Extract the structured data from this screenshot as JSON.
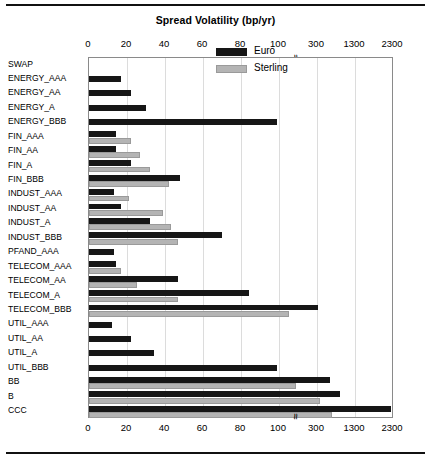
{
  "figure": {
    "title": "Spread Volatility (bp/yr)",
    "axis_break_symbol": "≈",
    "border_color": "#8a8a8a",
    "grid_color": "#dcdcdc"
  },
  "legend": {
    "position": "top-right-inside",
    "entries": [
      {
        "label": "Euro",
        "color": "#161616"
      },
      {
        "label": "Sterling",
        "color": "#b4b4b4"
      }
    ]
  },
  "axis": {
    "tick_labels": [
      "0",
      "20",
      "40",
      "60",
      "80",
      "100",
      "300",
      "1300",
      "2300"
    ],
    "tick_positions_px": [
      88,
      126,
      164,
      202,
      240,
      278,
      316,
      354,
      392
    ],
    "break_after": "100",
    "duplicated_top_and_bottom": true
  },
  "chart_data": {
    "type": "bar",
    "orientation": "horizontal",
    "title": "Spread Volatility (bp/yr)",
    "xlabel": "Spread Volatility (bp/yr)",
    "ylabel": "",
    "grid": true,
    "legend_position": "upper right inside",
    "x_ticks": [
      0,
      20,
      40,
      60,
      80,
      100,
      300,
      1300,
      2300
    ],
    "x_axis_broken": true,
    "x_break_between": [
      100,
      300
    ],
    "xlim": [
      0,
      2300
    ],
    "categories": [
      "SWAP",
      "ENERGY_AAA",
      "ENERGY_AA",
      "ENERGY_A",
      "ENERGY_BBB",
      "FIN_AAA",
      "FIN_AA",
      "FIN_A",
      "FIN_BBB",
      "INDUST_AAA",
      "INDUST_AA",
      "INDUST_A",
      "INDUST_BBB",
      "PFAND_AAA",
      "TELECOM_AAA",
      "TELECOM_AA",
      "TELECOM_A",
      "TELECOM_BBB",
      "UTIL_AAA",
      "UTIL_AA",
      "UTIL_A",
      "UTIL_BBB",
      "BB",
      "B",
      "CCC"
    ],
    "series": [
      {
        "name": "Euro",
        "color": "#161616",
        "values": [
          null,
          17,
          22,
          30,
          99,
          14,
          14,
          22,
          48,
          13,
          17,
          32,
          70,
          13,
          14,
          47,
          84,
          335,
          12,
          22,
          34,
          99,
          630,
          900,
          2250
        ]
      },
      {
        "name": "Sterling",
        "color": "#b4b4b4",
        "values": [
          null,
          null,
          null,
          null,
          null,
          22,
          27,
          32,
          42,
          21,
          39,
          43,
          47,
          null,
          17,
          25,
          47,
          155,
          null,
          null,
          null,
          null,
          190,
          390,
          700
        ]
      }
    ]
  }
}
